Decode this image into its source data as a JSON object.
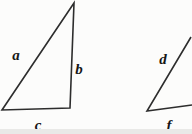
{
  "figure": {
    "background_color": "#fcfcfb",
    "line_color": "#2d2d2d",
    "label_color": "#161616",
    "scan_shadow_color": "#e9e9e7"
  },
  "labels": {
    "side_a": "a",
    "side_b": "b",
    "side_c": "c",
    "side_d": "d",
    "side_f": "f"
  }
}
